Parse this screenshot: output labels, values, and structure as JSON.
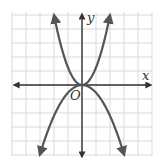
{
  "chart_data": {
    "type": "line",
    "title": "",
    "xlabel": "x",
    "ylabel": "y",
    "origin_label": "O",
    "grid": true,
    "xlim": [
      -5,
      5
    ],
    "ylim": [
      -5,
      5
    ],
    "colors": {
      "curve": "#555555",
      "axis": "#333333",
      "grid": "#d9d9d9",
      "background": "#ffffff"
    },
    "series": [
      {
        "name": "upper parabola (opens up)",
        "equation": "y ≈ 1.25x²",
        "a": 1.25,
        "x": [
          -2,
          -1.5,
          -1,
          -0.5,
          0,
          0.5,
          1,
          1.5,
          2
        ],
        "values": [
          5,
          2.81,
          1.25,
          0.31,
          0,
          0.31,
          1.25,
          2.81,
          5
        ]
      },
      {
        "name": "lower parabola (opens down)",
        "equation": "y ≈ -0.55x²",
        "a": -0.55,
        "x": [
          -3,
          -2,
          -1,
          0,
          1,
          2,
          3
        ],
        "values": [
          -4.95,
          -2.2,
          -0.55,
          0,
          -0.55,
          -2.2,
          -4.95
        ]
      }
    ]
  }
}
